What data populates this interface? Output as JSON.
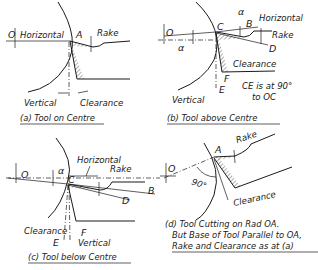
{
  "figure": {
    "colors": {
      "ink": "#1a1a1a",
      "background": "#ffffff"
    }
  },
  "panels": {
    "a": {
      "caption": "(a) Tool on Centre",
      "labels": {
        "O": "O",
        "horizontal": "Horizontal",
        "A": "A",
        "rake": "Rake",
        "vertical": "Vertical",
        "clearance": "Clearance"
      }
    },
    "b": {
      "caption": "(b) Tool above Centre",
      "labels": {
        "O": "O",
        "alpha_left": "α",
        "alpha_top": "α",
        "C": "C",
        "B": "B",
        "horizontal": "Horizontal",
        "rake": "Rake",
        "D": "D",
        "clearance": "Clearance",
        "F": "F",
        "E": "E",
        "vertical": "Vertical",
        "note_line1": "CE is at 90°",
        "note_line2": "to OC"
      }
    },
    "c": {
      "caption": "(c) Tool below Centre",
      "labels": {
        "O": "O",
        "alpha": "α",
        "C": "C",
        "horizontal": "Horizontal",
        "rake": "Rake",
        "B": "B",
        "D": "D",
        "clearance": "Clearance",
        "F": "F",
        "E": "E",
        "vertical": "Vertical"
      }
    },
    "d": {
      "caption_line1": "(d) Tool Cutting on Rad OA.",
      "caption_line2": "But Base of Tool Parallel to OA,",
      "caption_line3": "Rake and Clearance as at (a)",
      "labels": {
        "O": "O",
        "A": "A",
        "rake": "Rake",
        "angle": "90°",
        "clearance": "Clearance"
      }
    }
  }
}
